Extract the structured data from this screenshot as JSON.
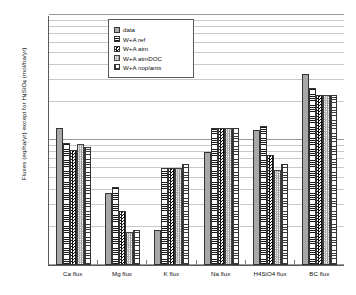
{
  "chart_data": {
    "type": "bar",
    "title": "",
    "xlabel": "",
    "ylabel": "Fluxes (eq/ha/yr) except for H4SiO4 (mol/ha/yr)",
    "yscale": "log",
    "ylim": [
      100,
      10000
    ],
    "ytick_labels": [
      "100",
      "1000",
      "10000"
    ],
    "grid": true,
    "legend_position": "top-center",
    "categories": [
      "Ca flux",
      "Mg flux",
      "K flux",
      "Na flux",
      "H4SiO4 flux",
      "BC flux"
    ],
    "series": [
      {
        "name": "data",
        "values": [
          1250,
          380,
          190,
          800,
          1200,
          3400
        ]
      },
      {
        "name": "W+A ref",
        "values": [
          950,
          420,
          600,
          1250,
          1300,
          2600
        ]
      },
      {
        "name": "W+A atm",
        "values": [
          830,
          270,
          600,
          1250,
          760,
          2300
        ]
      },
      {
        "name": "W+A atmDOC",
        "values": [
          930,
          185,
          600,
          1250,
          580,
          2300
        ]
      },
      {
        "name": "W+A noplants",
        "values": [
          880,
          190,
          640,
          1250,
          640,
          2300
        ]
      }
    ]
  },
  "legend": {
    "items": [
      {
        "label": "data"
      },
      {
        "label": "W+A ref"
      },
      {
        "label": "W+A atm"
      },
      {
        "label": "W+A atmDOC"
      },
      {
        "label": "W+A noplants"
      }
    ]
  },
  "axis": {
    "y_title_main": "Fluxes (eq/ha/yr) except for H",
    "y_title_sub": "4",
    "y_title_mid": "SiO",
    "y_title_sub2": "4",
    "y_title_end": " (mol/ha/yr)"
  }
}
